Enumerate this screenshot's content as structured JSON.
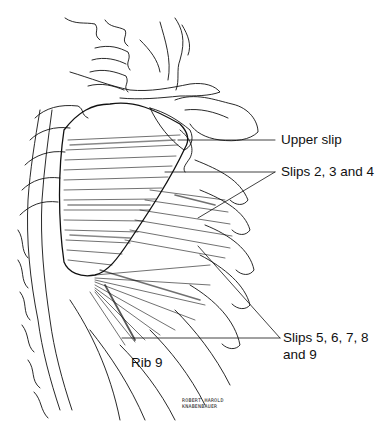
{
  "figure": {
    "background": "#ffffff",
    "line_color": "#111111"
  },
  "labels": {
    "upper_slip": "Upper slip",
    "slips_2_3_4": "Slips 2, 3 and 4",
    "slips_5_9_line1": "Slips 5, 6, 7, 8",
    "slips_5_9_line2": "and 9",
    "rib9": "Rib 9"
  },
  "credit": {
    "line1": "ROBERT HAROLD",
    "line2": "KNABENBAUER"
  }
}
